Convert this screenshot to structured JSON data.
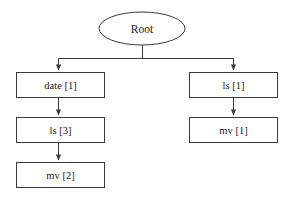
{
  "diagram": {
    "type": "tree",
    "title": "",
    "background_color": "#fefefe",
    "stroke_color": "#3a3a3a",
    "text_color": "#1a1a1a",
    "root": {
      "id": "root",
      "shape": "ellipse",
      "label": "Root"
    },
    "branches": [
      {
        "id": "left-branch",
        "nodes": [
          {
            "id": "left-node-1",
            "shape": "rectangle",
            "label": "date [1]"
          },
          {
            "id": "left-node-2",
            "shape": "rectangle",
            "label": "ls [3]"
          },
          {
            "id": "left-node-3",
            "shape": "rectangle",
            "label": "mv [2]"
          }
        ]
      },
      {
        "id": "right-branch",
        "nodes": [
          {
            "id": "right-node-1",
            "shape": "rectangle",
            "label": "ls [1]"
          },
          {
            "id": "right-node-2",
            "shape": "rectangle",
            "label": "mv [1]"
          }
        ]
      }
    ]
  }
}
